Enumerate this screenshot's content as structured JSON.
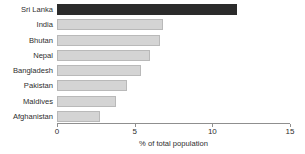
{
  "chart_data": {
    "type": "bar",
    "orientation": "horizontal",
    "title": "",
    "subtitle": "",
    "xlabel": "% of total population",
    "ylabel": "",
    "xlim": [
      0,
      15
    ],
    "xticks": [
      0,
      5,
      10,
      15
    ],
    "xtick_labels": [
      "0",
      "5",
      "10",
      "15"
    ],
    "grid": false,
    "legend": null,
    "categories": [
      "Sri Lanka",
      "India",
      "Bhutan",
      "Nepal",
      "Bangladesh",
      "Pakistan",
      "Maldives",
      "Afghanistan"
    ],
    "values": [
      11.6,
      6.8,
      6.6,
      6.0,
      5.4,
      4.5,
      3.8,
      2.8
    ],
    "highlight_category": "Sri Lanka",
    "colors": {
      "bar_fill": "#d4d4d4",
      "bar_border": "#b9b9b9",
      "highlight_fill": "#2b2b2b",
      "axis": "#8f8f8f",
      "text": "#2e2e2e"
    }
  }
}
